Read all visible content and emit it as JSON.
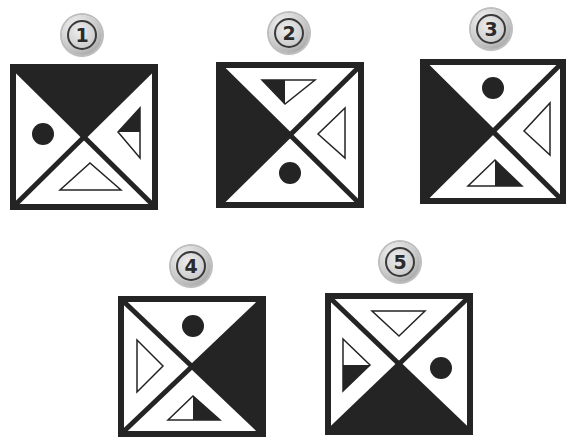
{
  "colors": {
    "ink": "#242424",
    "paper": "#ffffff",
    "badge_text": "#2b2b2b"
  },
  "options": [
    {
      "label": "1",
      "badge": {
        "cx": 82,
        "cy": 35
      },
      "square": {
        "x": 10,
        "y": 64,
        "size": 147
      },
      "dark_region": "top",
      "contents": {
        "left": "solid-circle",
        "right": "triangle-pointing-left-half-dark-top",
        "bottom": "hollow-triangle-pointing-up"
      }
    },
    {
      "label": "2",
      "badge": {
        "cx": 289,
        "cy": 33
      },
      "square": {
        "x": 217,
        "y": 62,
        "size": 147
      },
      "dark_region": "left",
      "contents": {
        "top": "triangle-pointing-down-half-dark-left",
        "right": "hollow-triangle-pointing-left",
        "bottom": "solid-circle"
      }
    },
    {
      "label": "3",
      "badge": {
        "cx": 491,
        "cy": 29
      },
      "square": {
        "x": 421,
        "y": 59,
        "size": 144
      },
      "dark_region": "left",
      "contents": {
        "top": "solid-circle",
        "right": "hollow-triangle-pointing-left",
        "bottom": "triangle-pointing-up-half-dark-right"
      }
    },
    {
      "label": "4",
      "badge": {
        "cx": 191,
        "cy": 266
      },
      "square": {
        "x": 118,
        "y": 296,
        "size": 146
      },
      "dark_region": "right",
      "contents": {
        "top": "solid-circle",
        "left": "hollow-triangle-pointing-right",
        "bottom": "triangle-pointing-up-half-dark-right"
      }
    },
    {
      "label": "5",
      "badge": {
        "cx": 400,
        "cy": 262
      },
      "square": {
        "x": 325,
        "y": 293,
        "size": 146
      },
      "dark_region": "bottom",
      "contents": {
        "top": "hollow-triangle-pointing-down",
        "left": "triangle-pointing-right-half-dark-bottom",
        "right": "solid-circle"
      }
    }
  ]
}
